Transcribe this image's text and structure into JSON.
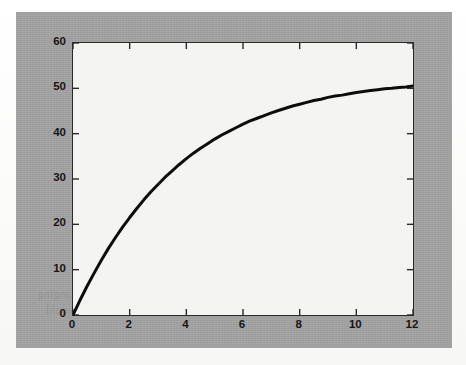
{
  "page": {
    "background_color": "#fdfdfc",
    "panel_color": "#a3a3a3",
    "axes_background": "#f4f4f2",
    "axis_color": "#2a2a2a",
    "curve_color": "#0d0d0d"
  },
  "showthrough_text": [
    {
      "text": "n changes to 5",
      "x": 236,
      "y": 36,
      "size": 11
    },
    {
      "text": "[ 2 0 0 0 0 ]",
      "x": 252,
      "y": 62,
      "size": 11
    },
    {
      "text": "with the result",
      "x": 268,
      "y": 92,
      "size": 11
    },
    {
      "text": "It simply be noted that once in MATLAB",
      "x": 190,
      "y": 196,
      "size": 11.5
    },
    {
      "text": "role of an independent function. For example",
      "x": 178,
      "y": 212,
      "size": 11.5
    },
    {
      "text": "similar to such time",
      "x": 252,
      "y": 228,
      "size": 11.5
    },
    {
      "text": "After difference are being placed as in allows or changing",
      "x": 22,
      "y": 276,
      "size": 11.5
    },
    {
      "text": "actual routines executes all to as a variable it would",
      "x": 30,
      "y": 292,
      "size": 11.5
    }
  ],
  "chart_data": {
    "type": "line",
    "title": "",
    "xlabel": "",
    "ylabel": "",
    "xlim": [
      0,
      12
    ],
    "ylim": [
      0,
      60
    ],
    "xticks": [
      0,
      2,
      4,
      6,
      8,
      10,
      12
    ],
    "yticks": [
      0,
      10,
      20,
      30,
      40,
      50,
      60
    ],
    "xtick_labels": [
      "0",
      "2",
      "4",
      "6",
      "8",
      "10",
      "12"
    ],
    "ytick_labels": [
      "0",
      "10",
      "20",
      "30",
      "40",
      "50",
      "60"
    ],
    "grid": false,
    "legend": null,
    "series": [
      {
        "name": "saturating-exponential",
        "line_color": "#0d0d0d",
        "line_width": 3,
        "x": [
          0,
          0.25,
          0.5,
          0.75,
          1,
          1.25,
          1.5,
          1.75,
          2,
          2.25,
          2.5,
          2.75,
          3,
          3.25,
          3.5,
          3.75,
          4,
          4.25,
          4.5,
          4.75,
          5,
          5.25,
          5.5,
          5.75,
          6,
          6.25,
          6.5,
          6.75,
          7,
          7.25,
          7.5,
          7.75,
          8,
          8.25,
          8.5,
          8.75,
          9,
          9.25,
          9.5,
          9.75,
          10,
          10.25,
          10.5,
          10.75,
          11,
          11.25,
          11.5,
          11.75,
          12
        ],
        "y": [
          0.0,
          3.3,
          6.4,
          9.3,
          12.1,
          14.7,
          17.1,
          19.4,
          21.5,
          23.5,
          25.4,
          27.2,
          28.8,
          30.4,
          31.8,
          33.2,
          34.5,
          35.7,
          36.8,
          37.8,
          38.8,
          39.7,
          40.5,
          41.3,
          42.1,
          42.8,
          43.4,
          44.0,
          44.6,
          45.1,
          45.6,
          46.1,
          46.5,
          46.9,
          47.3,
          47.6,
          48.0,
          48.3,
          48.5,
          48.8,
          49.1,
          49.3,
          49.5,
          49.7,
          49.9,
          50.0,
          50.2,
          50.3,
          50.5
        ]
      }
    ]
  }
}
